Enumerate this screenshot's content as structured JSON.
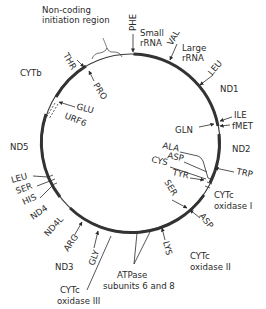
{
  "diagram": {
    "circle": {
      "cx": 131,
      "cy": 143,
      "r": 89,
      "color": "#333333"
    },
    "regions": {
      "noncoding": "Non-coding",
      "noncoding2": "initiation region",
      "small_rrna_1": "Small",
      "small_rrna_2": "rRNA",
      "large_rrna_1": "Large",
      "large_rrna_2": "rRNA",
      "cytb": "CYTb",
      "urf6": "URF6",
      "nd1": "ND1",
      "nd2": "ND2",
      "nd3": "ND3",
      "nd4": "ND4",
      "nd4l": "ND4L",
      "nd5": "ND5",
      "cox1_1": "CYTc",
      "cox1_2": "oxidase I",
      "cox2_1": "CYTc",
      "cox2_2": "oxidase II",
      "cox3_1": "CYTc",
      "cox3_2": "oxidase III",
      "atpase_1": "ATPase",
      "atpase_2": "subunits 6 and 8"
    },
    "trnas": {
      "phe": "PHE",
      "val": "VAL",
      "leu1": "LEU",
      "ile": "ILE",
      "fmet": "fMET",
      "gln": "GLN",
      "trp": "TRP",
      "ala": "ALA",
      "asp1": "ASP",
      "cys": "CYS",
      "tyr": "TYR",
      "ser1": "SER",
      "asp2": "ASP",
      "lys": "LYS",
      "gly": "GLY",
      "arg": "ARG",
      "his": "HIS",
      "ser2": "SER",
      "leu2": "LEU",
      "glu": "GLU",
      "pro": "PRO",
      "thr": "THR"
    }
  }
}
